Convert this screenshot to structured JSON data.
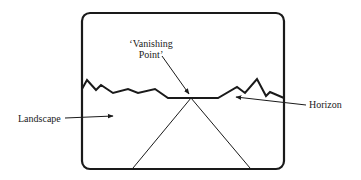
{
  "diagram": {
    "labels": {
      "vanishing_point_line1": "‘Vanishing",
      "vanishing_point_line2": "Point’",
      "landscape": "Landscape",
      "horizon": "Horizon"
    },
    "colors": {
      "stroke": "#1a1a1a",
      "text": "#222222",
      "background": "#ffffff"
    }
  }
}
